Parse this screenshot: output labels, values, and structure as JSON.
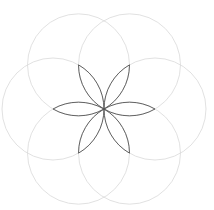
{
  "diagram": {
    "center": [
      104,
      109
    ],
    "radius": 51,
    "circle_angles_deg": [
      0,
      60,
      120,
      180,
      240,
      300
    ],
    "colors": {
      "background": "#ffffff",
      "circle_stroke": "#d9d9d9",
      "petal_stroke": "#555555"
    },
    "circle_stroke_width": 0.8,
    "petal_stroke_width": 0.9
  }
}
